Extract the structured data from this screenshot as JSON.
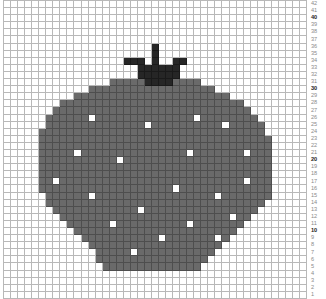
{
  "pattern": {
    "title": "Strawberry stitch chart",
    "columns": 43,
    "rows": 42,
    "colors": {
      "background": "#ffffff",
      "body": "#6a6a6a",
      "stem": "#262626",
      "seed": "#ffffff",
      "gridline": "#b8b8b8"
    },
    "row_labels": [
      "42",
      "41",
      "40",
      "39",
      "38",
      "37",
      "36",
      "35",
      "34",
      "33",
      "32",
      "31",
      "30",
      "29",
      "28",
      "27",
      "26",
      "25",
      "24",
      "23",
      "22",
      "21",
      "20",
      "19",
      "18",
      "17",
      "16",
      "15",
      "14",
      "13",
      "12",
      "11",
      "10",
      "9",
      "8",
      "7",
      "6",
      "5",
      "4",
      "3",
      "2",
      "1"
    ],
    "bold_labels": [
      "40",
      "30",
      "20",
      "10"
    ],
    "body_spans": [
      [
        11,
        15,
        27
      ],
      [
        12,
        12,
        29
      ],
      [
        13,
        10,
        31
      ],
      [
        14,
        8,
        33
      ],
      [
        15,
        7,
        34
      ],
      [
        16,
        6,
        35
      ],
      [
        17,
        6,
        36
      ],
      [
        18,
        5,
        36
      ],
      [
        19,
        5,
        37
      ],
      [
        20,
        5,
        37
      ],
      [
        21,
        5,
        37
      ],
      [
        22,
        5,
        37
      ],
      [
        23,
        5,
        37
      ],
      [
        24,
        5,
        37
      ],
      [
        25,
        5,
        37
      ],
      [
        26,
        5,
        37
      ],
      [
        27,
        6,
        37
      ],
      [
        28,
        6,
        36
      ],
      [
        29,
        7,
        35
      ],
      [
        30,
        8,
        34
      ],
      [
        31,
        9,
        33
      ],
      [
        32,
        10,
        32
      ],
      [
        33,
        11,
        31
      ],
      [
        34,
        12,
        30
      ],
      [
        35,
        13,
        29
      ],
      [
        36,
        13,
        28
      ],
      [
        37,
        14,
        27
      ]
    ],
    "stem_cells": [
      [
        6,
        21
      ],
      [
        7,
        21
      ],
      [
        8,
        17
      ],
      [
        8,
        18
      ],
      [
        8,
        19
      ],
      [
        8,
        21
      ],
      [
        8,
        24
      ],
      [
        8,
        25
      ],
      [
        9,
        19
      ],
      [
        9,
        20
      ],
      [
        9,
        21
      ],
      [
        9,
        22
      ],
      [
        9,
        23
      ],
      [
        9,
        24
      ],
      [
        10,
        19
      ],
      [
        10,
        20
      ],
      [
        10,
        21
      ],
      [
        10,
        22
      ],
      [
        10,
        23
      ],
      [
        10,
        24
      ],
      [
        11,
        20
      ],
      [
        11,
        21
      ],
      [
        11,
        22
      ],
      [
        11,
        23
      ]
    ],
    "seed_cells": [
      [
        16,
        12
      ],
      [
        17,
        20
      ],
      [
        16,
        27
      ],
      [
        17,
        31
      ],
      [
        21,
        10
      ],
      [
        22,
        16
      ],
      [
        21,
        26
      ],
      [
        21,
        34
      ],
      [
        25,
        7
      ],
      [
        25,
        34
      ],
      [
        26,
        24
      ],
      [
        27,
        12
      ],
      [
        27,
        30
      ],
      [
        29,
        19
      ],
      [
        30,
        32
      ],
      [
        31,
        15
      ],
      [
        31,
        26
      ],
      [
        33,
        22
      ],
      [
        33,
        30
      ],
      [
        35,
        18
      ]
    ]
  }
}
